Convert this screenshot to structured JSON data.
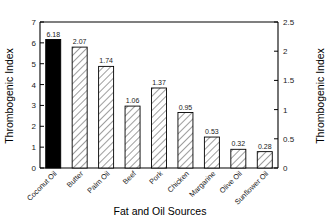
{
  "chart_data": {
    "type": "bar",
    "title": "",
    "xlabel": "Fat and Oil Sources",
    "ylabel": "Thrombogenic Index",
    "ylabel_right": "Thrombogenic Index",
    "categories": [
      "Coconut Oil",
      "Butter",
      "Palm Oil",
      "Beef",
      "Pork",
      "Chicken",
      "Margarine",
      "Olive Oil",
      "Sunflower Oil"
    ],
    "values": [
      6.18,
      2.07,
      1.74,
      1.06,
      1.37,
      0.95,
      0.53,
      0.32,
      0.28
    ],
    "plotted_heights": [
      2.2,
      2.07,
      1.74,
      1.06,
      1.37,
      0.95,
      0.53,
      0.32,
      0.28
    ],
    "data_labels": [
      "6.18",
      "2.07",
      "1.74",
      "1.06",
      "1.37",
      "0.95",
      "0.53",
      "0.32",
      "0.28"
    ],
    "left_axis": {
      "ticks": [
        "0",
        "1",
        "2",
        "3",
        "4",
        "5",
        "6",
        "7"
      ],
      "ylim": [
        0,
        7
      ]
    },
    "right_axis": {
      "ticks": [
        "0",
        "0.5",
        "1",
        "1.5",
        "2",
        "2.5"
      ],
      "ylim": [
        0,
        2.5
      ]
    },
    "grid": false,
    "legend": "none",
    "bar_styles": [
      "solid-black",
      "hatched",
      "hatched",
      "hatched",
      "hatched",
      "hatched",
      "hatched",
      "hatched",
      "hatched"
    ],
    "colors": {
      "highlight_bar": "#000000",
      "bar_fill": "#ffffff",
      "bar_stroke": "#000000",
      "axis": "#000000",
      "background": "#ffffff"
    }
  }
}
